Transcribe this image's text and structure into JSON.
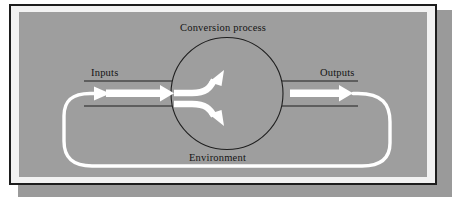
{
  "figure": {
    "kind": "systems-conversion-process-diagram",
    "labels": {
      "conversion_process": "Conversion process",
      "inputs": "Inputs",
      "outputs": "Outputs",
      "environment": "Environment"
    },
    "colors": {
      "page_background": "#ffffff",
      "panel_gray": "#9e9e9e",
      "plate_gray": "#9a9a9a",
      "mat_white": "#f2f2f2",
      "frame_dark": "#1d1d1d",
      "line_dark": "#1f1f1f",
      "flow_white": "#ffffff"
    },
    "elements": {
      "input_channel": "horizontal band entering from the left into the circle",
      "output_channel": "horizontal band leaving the circle to the right",
      "conversion_circle": "large central circle outlined in dark",
      "internal_arrows": "two white curved arrows diverging inside the circle",
      "feedback_loop": "white rounded path from output around the bottom back into the input"
    }
  }
}
